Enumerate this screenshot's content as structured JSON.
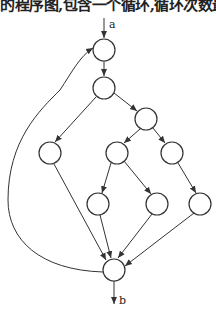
{
  "caption": "的程序图,包含一个循环,循环次数最",
  "diagram": {
    "entry_label": "a",
    "exit_label": "b",
    "nodes": [
      {
        "id": "n1",
        "x": 104,
        "y": 50
      },
      {
        "id": "n2",
        "x": 104,
        "y": 88
      },
      {
        "id": "n3",
        "x": 146,
        "y": 119
      },
      {
        "id": "n4",
        "x": 50,
        "y": 153
      },
      {
        "id": "n5",
        "x": 117,
        "y": 153
      },
      {
        "id": "n6",
        "x": 172,
        "y": 153
      },
      {
        "id": "n7",
        "x": 98,
        "y": 204
      },
      {
        "id": "n8",
        "x": 157,
        "y": 204
      },
      {
        "id": "n9",
        "x": 200,
        "y": 204
      },
      {
        "id": "n10",
        "x": 114,
        "y": 270
      }
    ],
    "edges": [
      [
        "n1",
        "n2"
      ],
      [
        "n2",
        "n4"
      ],
      [
        "n2",
        "n3"
      ],
      [
        "n3",
        "n5"
      ],
      [
        "n3",
        "n6"
      ],
      [
        "n5",
        "n7"
      ],
      [
        "n5",
        "n8"
      ],
      [
        "n6",
        "n9"
      ],
      [
        "n4",
        "n10"
      ],
      [
        "n7",
        "n10"
      ],
      [
        "n8",
        "n10"
      ],
      [
        "n9",
        "n10"
      ],
      [
        "n10",
        "n1",
        "loop"
      ]
    ]
  }
}
